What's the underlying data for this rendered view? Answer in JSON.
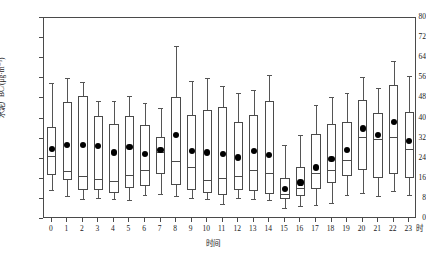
{
  "chart_data": {
    "type": "box",
    "title": "",
    "xlabel": "时间",
    "ylabel": "水泥厂BC/(μg·m⁻³)",
    "x_unit_suffix": "时",
    "ylim": [
      0,
      80
    ],
    "y_ticks": [
      0,
      8,
      16,
      24,
      32,
      40,
      48,
      56,
      64,
      72,
      80
    ],
    "grid": false,
    "legend": "none",
    "categories": [
      "0",
      "1",
      "2",
      "3",
      "4",
      "5",
      "6",
      "7",
      "8",
      "9",
      "10",
      "11",
      "12",
      "13",
      "14",
      "15",
      "16",
      "17",
      "18",
      "19",
      "20",
      "21",
      "22",
      "23"
    ],
    "series_name": "水泥厂BC",
    "boxes": [
      {
        "category": "0",
        "whisker_low": 11.5,
        "q1": 17.5,
        "median": 25.0,
        "q3": 36.5,
        "whisker_high": 54.0,
        "mean": 28.0
      },
      {
        "category": "1",
        "whisker_low": 9.0,
        "q1": 15.5,
        "median": 19.0,
        "q3": 46.5,
        "whisker_high": 56.0,
        "mean": 29.5
      },
      {
        "category": "2",
        "whisker_low": 8.0,
        "q1": 11.5,
        "median": 17.0,
        "q3": 49.0,
        "whisker_high": 54.5,
        "mean": 29.5
      },
      {
        "category": "3",
        "whisker_low": 8.5,
        "q1": 11.5,
        "median": 16.0,
        "q3": 41.0,
        "whisker_high": 47.0,
        "mean": 29.0
      },
      {
        "category": "4",
        "whisker_low": 8.0,
        "q1": 10.5,
        "median": 15.0,
        "q3": 38.0,
        "whisker_high": 47.0,
        "mean": 26.5
      },
      {
        "category": "5",
        "whisker_low": 7.5,
        "q1": 12.5,
        "median": 17.5,
        "q3": 41.0,
        "whisker_high": 49.0,
        "mean": 28.5
      },
      {
        "category": "6",
        "whisker_low": 9.5,
        "q1": 13.0,
        "median": 19.5,
        "q3": 37.5,
        "whisker_high": 46.0,
        "mean": 26.0
      },
      {
        "category": "7",
        "whisker_low": 10.0,
        "q1": 18.0,
        "median": 26.5,
        "q3": 32.5,
        "whisker_high": 44.0,
        "mean": 27.5
      },
      {
        "category": "8",
        "whisker_low": 9.0,
        "q1": 13.5,
        "median": 23.0,
        "q3": 48.5,
        "whisker_high": 69.0,
        "mean": 33.5
      },
      {
        "category": "9",
        "whisker_low": 8.5,
        "q1": 11.5,
        "median": 20.5,
        "q3": 41.5,
        "whisker_high": 55.0,
        "mean": 27.0
      },
      {
        "category": "10",
        "whisker_low": 8.0,
        "q1": 10.5,
        "median": 15.5,
        "q3": 43.5,
        "whisker_high": 56.0,
        "mean": 26.5
      },
      {
        "category": "11",
        "whisker_low": 6.0,
        "q1": 9.5,
        "median": 16.5,
        "q3": 44.5,
        "whisker_high": 53.0,
        "mean": 26.0
      },
      {
        "category": "12",
        "whisker_low": 8.5,
        "q1": 11.5,
        "median": 17.0,
        "q3": 38.5,
        "whisker_high": 50.0,
        "mean": 24.5
      },
      {
        "category": "13",
        "whisker_low": 8.0,
        "q1": 11.0,
        "median": 19.5,
        "q3": 41.5,
        "whisker_high": 51.5,
        "mean": 27.0
      },
      {
        "category": "14",
        "whisker_low": 7.5,
        "q1": 10.0,
        "median": 18.5,
        "q3": 47.0,
        "whisker_high": 57.5,
        "mean": 25.5
      },
      {
        "category": "15",
        "whisker_low": 4.5,
        "q1": 8.0,
        "median": 10.0,
        "q3": 16.5,
        "whisker_high": 29.5,
        "mean": 12.0
      },
      {
        "category": "16",
        "whisker_low": 5.0,
        "q1": 9.0,
        "median": 12.5,
        "q3": 20.5,
        "whisker_high": 33.5,
        "mean": 14.5
      },
      {
        "category": "17",
        "whisker_low": 5.5,
        "q1": 12.0,
        "median": 18.5,
        "q3": 34.0,
        "whisker_high": 45.5,
        "mean": 20.5
      },
      {
        "category": "18",
        "whisker_low": 6.5,
        "q1": 14.5,
        "median": 19.5,
        "q3": 38.0,
        "whisker_high": 48.5,
        "mean": 24.0
      },
      {
        "category": "19",
        "whisker_low": 9.5,
        "q1": 17.0,
        "median": 23.5,
        "q3": 38.5,
        "whisker_high": 50.0,
        "mean": 27.5
      },
      {
        "category": "20",
        "whisker_low": 10.5,
        "q1": 19.5,
        "median": 32.5,
        "q3": 47.5,
        "whisker_high": 56.5,
        "mean": 36.0
      },
      {
        "category": "21",
        "whisker_low": 9.0,
        "q1": 16.5,
        "median": 32.0,
        "q3": 42.0,
        "whisker_high": 52.0,
        "mean": 33.5
      },
      {
        "category": "22",
        "whisker_low": 11.0,
        "q1": 18.0,
        "median": 32.5,
        "q3": 53.5,
        "whisker_high": 63.0,
        "mean": 38.5
      },
      {
        "category": "23",
        "whisker_low": 9.5,
        "q1": 16.5,
        "median": 28.0,
        "q3": 42.5,
        "whisker_high": 57.0,
        "mean": 31.0
      }
    ]
  },
  "axes": {
    "y_tick_labels": [
      "0",
      "8",
      "16",
      "24",
      "32",
      "40",
      "48",
      "56",
      "64",
      "72",
      "80"
    ],
    "x_tick_labels": [
      "0",
      "1",
      "2",
      "3",
      "4",
      "5",
      "6",
      "7",
      "8",
      "9",
      "10",
      "11",
      "12",
      "13",
      "14",
      "15",
      "16",
      "17",
      "18",
      "19",
      "20",
      "21",
      "22",
      "23"
    ]
  },
  "colors": {
    "frame": "#4a4a4a",
    "box_stroke": "#4a4a4a",
    "whisker": "#555555",
    "mean_marker": "#000000",
    "background": "#ffffff"
  }
}
